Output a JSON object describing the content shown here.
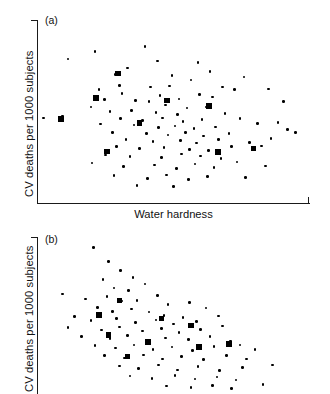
{
  "figure": {
    "xlabel": "Water hardness",
    "ylabel": "CV deaths per 1000 subjects",
    "panel_a_tag": "(a)",
    "panel_b_tag": "(b)"
  },
  "chart_data": [
    {
      "type": "scatter",
      "panel": "(a)",
      "title": "",
      "xlabel": "Water hardness",
      "ylabel": "CV deaths per 1000 subjects",
      "xlim": [
        0,
        100
      ],
      "ylim": [
        0,
        100
      ],
      "grid": false,
      "legend": "none",
      "axis_ticks_labeled": false,
      "description": "Diffuse scatter cloud with no clear trend between water hardness and CV deaths.",
      "series": [
        {
          "name": "small-marker-towns",
          "marker": "circle",
          "marker_size": "small",
          "color": "#000000",
          "points": [
            [
              21.0,
              83.0
            ],
            [
              39.5,
              86.0
            ],
            [
              11.0,
              79.0
            ],
            [
              44.0,
              78.0
            ],
            [
              33.0,
              74.0
            ],
            [
              59.0,
              77.0
            ],
            [
              28.5,
              70.5
            ],
            [
              49.5,
              70.0
            ],
            [
              30.0,
              64.5
            ],
            [
              63.5,
              72.0
            ],
            [
              76.0,
              69.0
            ],
            [
              22.5,
              62.0
            ],
            [
              56.5,
              67.5
            ],
            [
              41.5,
              63.5
            ],
            [
              48.5,
              64.0
            ],
            [
              68.0,
              63.5
            ],
            [
              72.5,
              62.0
            ],
            [
              85.0,
              62.5
            ],
            [
              31.0,
              60.0
            ],
            [
              45.0,
              59.0
            ],
            [
              59.5,
              59.5
            ],
            [
              64.5,
              58.0
            ],
            [
              24.5,
              56.5
            ],
            [
              36.0,
              56.0
            ],
            [
              52.0,
              57.0
            ],
            [
              41.0,
              55.5
            ],
            [
              90.5,
              55.5
            ],
            [
              19.5,
              52.5
            ],
            [
              47.0,
              53.5
            ],
            [
              55.0,
              52.0
            ],
            [
              62.0,
              52.5
            ],
            [
              26.5,
              50.0
            ],
            [
              34.5,
              50.5
            ],
            [
              43.5,
              49.5
            ],
            [
              51.5,
              48.5
            ],
            [
              69.0,
              49.0
            ],
            [
              2.0,
              46.5
            ],
            [
              9.0,
              47.5
            ],
            [
              30.5,
              46.0
            ],
            [
              38.5,
              45.0
            ],
            [
              46.0,
              46.5
            ],
            [
              53.5,
              44.5
            ],
            [
              60.5,
              45.5
            ],
            [
              74.5,
              46.0
            ],
            [
              23.0,
              43.0
            ],
            [
              35.5,
              42.5
            ],
            [
              44.5,
              41.0
            ],
            [
              50.5,
              42.0
            ],
            [
              57.5,
              40.5
            ],
            [
              65.5,
              41.5
            ],
            [
              81.0,
              43.5
            ],
            [
              88.5,
              44.0
            ],
            [
              27.5,
              38.5
            ],
            [
              40.0,
              38.0
            ],
            [
              48.0,
              37.0
            ],
            [
              54.5,
              38.5
            ],
            [
              61.0,
              36.5
            ],
            [
              70.5,
              38.0
            ],
            [
              92.0,
              40.0
            ],
            [
              95.0,
              38.5
            ],
            [
              32.5,
              34.5
            ],
            [
              42.5,
              33.5
            ],
            [
              52.5,
              34.0
            ],
            [
              58.5,
              32.5
            ],
            [
              66.5,
              34.5
            ],
            [
              78.0,
              33.0
            ],
            [
              86.0,
              35.0
            ],
            [
              29.0,
              30.5
            ],
            [
              37.5,
              29.5
            ],
            [
              46.5,
              30.0
            ],
            [
              56.0,
              29.0
            ],
            [
              63.0,
              28.5
            ],
            [
              71.5,
              30.5
            ],
            [
              82.5,
              31.0
            ],
            [
              25.0,
              26.0
            ],
            [
              34.0,
              25.0
            ],
            [
              45.5,
              24.5
            ],
            [
              53.0,
              26.5
            ],
            [
              60.0,
              25.5
            ],
            [
              67.5,
              24.0
            ],
            [
              20.0,
              21.5
            ],
            [
              31.5,
              19.5
            ],
            [
              43.0,
              20.5
            ],
            [
              51.0,
              18.5
            ],
            [
              58.0,
              21.0
            ],
            [
              65.0,
              19.0
            ],
            [
              73.5,
              22.0
            ],
            [
              84.0,
              20.0
            ],
            [
              28.0,
              14.5
            ],
            [
              40.5,
              13.0
            ],
            [
              47.5,
              15.0
            ],
            [
              55.5,
              12.5
            ],
            [
              62.5,
              14.0
            ],
            [
              76.5,
              13.5
            ],
            [
              36.5,
              9.0
            ],
            [
              50.0,
              8.5
            ]
          ]
        },
        {
          "name": "large-marker-towns",
          "marker": "square",
          "marker_size": "large",
          "color": "#000000",
          "points": [
            [
              29.5,
              71.0
            ],
            [
              21.5,
              57.5
            ],
            [
              8.5,
              46.0
            ],
            [
              47.5,
              56.0
            ],
            [
              63.0,
              53.0
            ],
            [
              37.5,
              43.5
            ],
            [
              25.5,
              28.0
            ],
            [
              66.5,
              27.5
            ],
            [
              79.5,
              29.5
            ]
          ]
        }
      ]
    },
    {
      "type": "scatter",
      "panel": "(b)",
      "title": "",
      "xlabel": "Water hardness",
      "ylabel": "CV deaths per 1000 subjects",
      "xlim": [
        0,
        100
      ],
      "ylim": [
        0,
        100
      ],
      "grid": false,
      "legend": "none",
      "axis_ticks_labeled": false,
      "note": "Panel is cropped at the bottom edge of the image; x-axis not visible.",
      "description": "Scatter showing a clear negative association: CV deaths fall as water hardness rises.",
      "series": [
        {
          "name": "small-marker-towns",
          "marker": "circle",
          "marker_size": "small",
          "color": "#000000",
          "points": [
            [
              20.5,
              94.0
            ],
            [
              26.0,
              85.0
            ],
            [
              30.5,
              79.0
            ],
            [
              24.0,
              73.5
            ],
            [
              35.0,
              74.5
            ],
            [
              28.0,
              68.0
            ],
            [
              33.5,
              66.5
            ],
            [
              39.5,
              70.5
            ],
            [
              9.0,
              64.0
            ],
            [
              17.5,
              61.0
            ],
            [
              25.5,
              62.5
            ],
            [
              31.0,
              59.5
            ],
            [
              36.5,
              60.0
            ],
            [
              44.0,
              63.0
            ],
            [
              48.0,
              57.5
            ],
            [
              22.0,
              55.5
            ],
            [
              27.5,
              53.0
            ],
            [
              34.5,
              54.5
            ],
            [
              41.0,
              52.5
            ],
            [
              46.5,
              50.5
            ],
            [
              56.0,
              58.5
            ],
            [
              62.0,
              55.0
            ],
            [
              13.5,
              49.5
            ],
            [
              19.5,
              47.0
            ],
            [
              29.0,
              48.5
            ],
            [
              36.0,
              46.0
            ],
            [
              43.5,
              47.5
            ],
            [
              50.0,
              45.0
            ],
            [
              53.5,
              49.0
            ],
            [
              58.5,
              46.5
            ],
            [
              66.5,
              50.0
            ],
            [
              11.0,
              42.5
            ],
            [
              23.5,
              41.0
            ],
            [
              30.0,
              43.0
            ],
            [
              38.5,
              40.5
            ],
            [
              45.5,
              42.0
            ],
            [
              52.0,
              39.5
            ],
            [
              60.0,
              41.5
            ],
            [
              68.0,
              43.5
            ],
            [
              16.0,
              37.0
            ],
            [
              26.5,
              35.5
            ],
            [
              33.0,
              37.5
            ],
            [
              40.0,
              34.5
            ],
            [
              47.0,
              36.0
            ],
            [
              55.5,
              35.0
            ],
            [
              63.5,
              37.0
            ],
            [
              71.0,
              34.0
            ],
            [
              21.0,
              31.0
            ],
            [
              28.5,
              29.5
            ],
            [
              35.5,
              31.5
            ],
            [
              42.5,
              28.5
            ],
            [
              49.5,
              30.0
            ],
            [
              57.0,
              28.0
            ],
            [
              65.0,
              30.5
            ],
            [
              74.5,
              31.5
            ],
            [
              80.0,
              28.5
            ],
            [
              24.5,
              24.5
            ],
            [
              32.0,
              23.0
            ],
            [
              39.0,
              25.0
            ],
            [
              46.0,
              22.5
            ],
            [
              53.0,
              24.0
            ],
            [
              61.0,
              22.0
            ],
            [
              69.5,
              24.5
            ],
            [
              77.0,
              22.5
            ],
            [
              30.0,
              18.0
            ],
            [
              37.0,
              16.5
            ],
            [
              44.5,
              18.5
            ],
            [
              51.5,
              15.5
            ],
            [
              59.0,
              17.5
            ],
            [
              67.0,
              15.0
            ],
            [
              75.5,
              17.0
            ],
            [
              86.5,
              18.5
            ],
            [
              34.0,
              11.5
            ],
            [
              42.0,
              10.0
            ],
            [
              50.5,
              12.0
            ],
            [
              58.0,
              9.5
            ],
            [
              66.0,
              11.0
            ],
            [
              73.0,
              9.0
            ],
            [
              47.5,
              5.0
            ],
            [
              56.5,
              4.0
            ],
            [
              64.5,
              5.5
            ],
            [
              71.5,
              3.5
            ],
            [
              83.0,
              6.0
            ]
          ]
        },
        {
          "name": "large-marker-towns",
          "marker": "square",
          "marker_size": "large",
          "color": "#000000",
          "points": [
            [
              30.0,
              60.0
            ],
            [
              22.5,
              50.5
            ],
            [
              26.0,
              38.0
            ],
            [
              45.5,
              48.5
            ],
            [
              56.5,
              44.0
            ],
            [
              40.5,
              33.5
            ],
            [
              33.0,
              24.0
            ],
            [
              59.5,
              30.0
            ],
            [
              70.5,
              32.0
            ]
          ]
        }
      ]
    }
  ]
}
